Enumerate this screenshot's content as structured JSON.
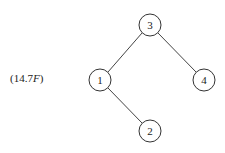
{
  "equation_label": {
    "prefix": "(14.7",
    "italic": "F",
    "suffix": ")"
  },
  "tree": {
    "nodes": [
      {
        "id": "3",
        "label": "3",
        "x": 150,
        "y": 25
      },
      {
        "id": "1",
        "label": "1",
        "x": 100,
        "y": 80
      },
      {
        "id": "4",
        "label": "4",
        "x": 204,
        "y": 80
      },
      {
        "id": "2",
        "label": "2",
        "x": 150,
        "y": 131
      }
    ],
    "edges": [
      {
        "from": "3",
        "to": "1"
      },
      {
        "from": "3",
        "to": "4"
      },
      {
        "from": "1",
        "to": "2"
      }
    ],
    "node_radius": 11,
    "root": "3"
  }
}
